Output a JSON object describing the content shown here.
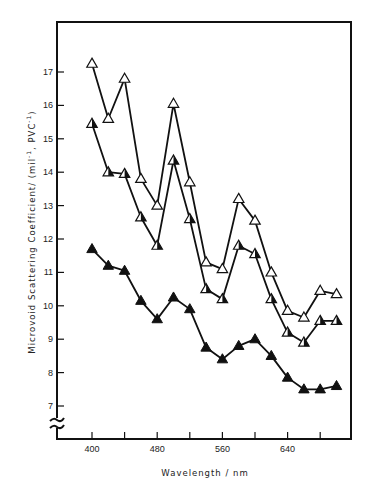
{
  "chart_data": {
    "type": "line",
    "title": "",
    "xlabel": "Wavelength / nm",
    "ylabel": "Microvoid Scattering Coefficient/ (mil⁻¹, PVC⁻¹)",
    "x_ticks": [
      400,
      480,
      560,
      640
    ],
    "x_minor_ticks": [
      400,
      440,
      480,
      520,
      560,
      600,
      640,
      680
    ],
    "y_ticks": [
      7,
      8,
      9,
      10,
      11,
      12,
      13,
      14,
      15,
      16,
      17
    ],
    "xlim": [
      378,
      722
    ],
    "ylim": [
      6.0,
      18.5
    ],
    "y_axis_break": true,
    "grid": false,
    "legend": null,
    "x": [
      400,
      420,
      440,
      460,
      480,
      500,
      520,
      540,
      560,
      580,
      600,
      620,
      640,
      660,
      680,
      700
    ],
    "series": [
      {
        "name": "open-triangle series (top)",
        "marker": "open-triangle",
        "values": [
          17.25,
          15.6,
          16.8,
          13.8,
          13.0,
          16.05,
          13.7,
          11.3,
          11.1,
          13.2,
          12.55,
          11.0,
          9.85,
          9.65,
          10.45,
          10.35
        ]
      },
      {
        "name": "half-filled triangle series (middle)",
        "marker": "half-filled-triangle",
        "values": [
          15.45,
          14.0,
          13.95,
          12.65,
          11.8,
          14.35,
          12.6,
          10.5,
          10.2,
          11.8,
          11.55,
          10.2,
          9.2,
          8.9,
          9.55,
          9.55
        ]
      },
      {
        "name": "filled triangle series (bottom)",
        "marker": "filled-triangle",
        "values": [
          11.7,
          11.2,
          11.05,
          10.15,
          9.6,
          10.25,
          9.9,
          8.75,
          8.4,
          8.8,
          9.0,
          8.5,
          7.85,
          7.5,
          7.5,
          7.6
        ]
      }
    ]
  },
  "axes": {
    "x_title": "Wavelength / nm",
    "y_title_main": "Microvoid Scattering Coefficient/ (mil",
    "y_title_sup1": "-1",
    "y_title_mid": ", PVC",
    "y_title_sup2": "-1",
    "y_title_end": ")"
  },
  "colors": {
    "line": "#111111",
    "frame": "#111111",
    "background": "#ffffff"
  }
}
